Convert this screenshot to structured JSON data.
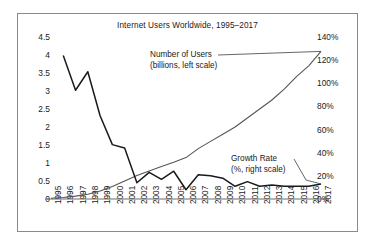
{
  "chart_data": {
    "type": "line",
    "title": "Internet Users Worldwide, 1995–2017",
    "xlabel": "",
    "grid": false,
    "legend_position": "inline-annotations",
    "categories": [
      "1995",
      "1996",
      "1997",
      "1998",
      "1999",
      "2000",
      "2001",
      "2002",
      "2003",
      "2004",
      "2005",
      "2006",
      "2007",
      "2008",
      "2009",
      "2010",
      "2011",
      "2012",
      "2013",
      "2014",
      "2015",
      "2016",
      "2017"
    ],
    "axes": {
      "left": {
        "label": "billions",
        "ticks": [
          "0",
          "0.5",
          "1",
          "1.5",
          "2",
          "2.5",
          "3",
          "3.5",
          "4",
          "4.5"
        ],
        "tick_values": [
          0,
          0.5,
          1,
          1.5,
          2,
          2.5,
          3,
          3.5,
          4,
          4.5
        ],
        "ylim": [
          0,
          4.5
        ]
      },
      "right": {
        "label": "%",
        "ticks": [
          "0%",
          "20%",
          "40%",
          "60%",
          "80%",
          "100%",
          "120%",
          "140%"
        ],
        "tick_values": [
          0,
          20,
          40,
          60,
          80,
          100,
          120,
          140
        ],
        "ylim": [
          0,
          140
        ]
      }
    },
    "series": [
      {
        "name": "Number of Users",
        "annotation_line1": "Number of Users",
        "annotation_line2": "(billions, left scale)",
        "axis": "left",
        "unit": "billions",
        "values": [
          0.02,
          0.04,
          0.08,
          0.13,
          0.22,
          0.35,
          0.5,
          0.65,
          0.78,
          0.9,
          1.02,
          1.15,
          1.4,
          1.6,
          1.8,
          2.0,
          2.25,
          2.5,
          2.75,
          3.05,
          3.4,
          3.7,
          4.1
        ]
      },
      {
        "name": "Growth Rate",
        "annotation_line1": "Growth Rate",
        "annotation_line2": "(%, right scale)",
        "axis": "right",
        "unit": "%",
        "values": [
          null,
          124,
          94,
          110,
          72,
          47,
          44,
          14,
          23,
          17,
          24,
          8,
          21,
          20,
          18,
          11,
          15,
          11,
          12,
          11,
          11,
          11,
          13
        ]
      }
    ]
  }
}
